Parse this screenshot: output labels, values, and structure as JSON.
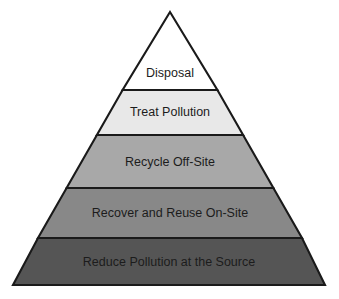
{
  "diagram": {
    "type": "pyramid",
    "name": "pollution-prevention-hierarchy",
    "background_color": "#ffffff",
    "outline_color": "#1a1a1a",
    "text_color": "#1c1c1c",
    "apex": {
      "x": 170,
      "y": 12
    },
    "base": {
      "left_x": 13,
      "right_x": 325,
      "y": 285
    },
    "tiers": [
      {
        "rank": 1,
        "position": "top",
        "label": "Disposal",
        "fill_color": "#ffffff",
        "top_y": 12,
        "bottom_y": 90,
        "label_y": 74,
        "font_size": 12.5
      },
      {
        "rank": 2,
        "position": "second",
        "label": "Treat Pollution",
        "fill_color": "#e8e8e8",
        "top_y": 90,
        "bottom_y": 135,
        "label_y": 113,
        "font_size": 12.5
      },
      {
        "rank": 3,
        "position": "middle",
        "label": "Recycle Off-Site",
        "fill_color": "#a8a8a8",
        "top_y": 135,
        "bottom_y": 188,
        "label_y": 163,
        "font_size": 12.5
      },
      {
        "rank": 4,
        "position": "fourth",
        "label": "Recover and Reuse On-Site",
        "fill_color": "#888888",
        "top_y": 188,
        "bottom_y": 238,
        "label_y": 214,
        "font_size": 12.5
      },
      {
        "rank": 5,
        "position": "bottom",
        "label": "Reduce Pollution at the Source",
        "fill_color": "#555555",
        "top_y": 238,
        "bottom_y": 285,
        "label_y": 263,
        "font_size": 12.5
      }
    ]
  },
  "chart_data": {
    "type": "pyramid",
    "title": "",
    "categories": [
      "Disposal",
      "Treat Pollution",
      "Recycle Off-Site",
      "Recover and Reuse On-Site",
      "Reduce Pollution at the Source"
    ],
    "values": [
      1,
      2,
      3,
      4,
      5
    ],
    "value_meaning": "hierarchy rank from least preferred (top) to most preferred (bottom)",
    "colors": [
      "#ffffff",
      "#e8e8e8",
      "#a8a8a8",
      "#888888",
      "#555555"
    ],
    "legend": [],
    "xlabel": "",
    "ylabel": "",
    "grid": false
  }
}
